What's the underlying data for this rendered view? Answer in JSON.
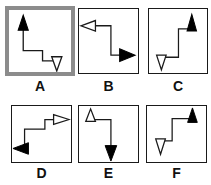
{
  "figure": {
    "background_color": "#ffffff",
    "stroke_color": "#1a1a1a",
    "fill_color": "#000000",
    "open_fill_color": "#ffffff",
    "selection_color": "#8c8c8c",
    "panel_count": 6,
    "rows": 2,
    "columns": 3
  },
  "panels": [
    {
      "id": "A",
      "label": "A",
      "selected": true,
      "start_arrow": {
        "name": "filled-up-arrow",
        "direction": "up",
        "style": "filled",
        "position": "top-left"
      },
      "end_arrow": {
        "name": "open-down-arrow",
        "direction": "down",
        "style": "open",
        "position": "bottom-right"
      },
      "path": "descending-staircase"
    },
    {
      "id": "B",
      "label": "B",
      "selected": false,
      "start_arrow": {
        "name": "open-left-arrow",
        "direction": "left",
        "style": "open",
        "position": "top-left"
      },
      "end_arrow": {
        "name": "filled-right-arrow",
        "direction": "right",
        "style": "filled",
        "position": "bottom-right"
      },
      "path": "descending-staircase"
    },
    {
      "id": "C",
      "label": "C",
      "selected": false,
      "start_arrow": {
        "name": "open-down-arrow",
        "direction": "down",
        "style": "open",
        "position": "bottom-left"
      },
      "end_arrow": {
        "name": "filled-up-arrow",
        "direction": "up",
        "style": "filled",
        "position": "top-right"
      },
      "path": "ascending-staircase"
    },
    {
      "id": "D",
      "label": "D",
      "selected": false,
      "start_arrow": {
        "name": "filled-left-arrow",
        "direction": "left",
        "style": "filled",
        "position": "bottom-left"
      },
      "end_arrow": {
        "name": "open-right-arrow",
        "direction": "right",
        "style": "open",
        "position": "top-right"
      },
      "path": "ascending-staircase"
    },
    {
      "id": "E",
      "label": "E",
      "selected": false,
      "start_arrow": {
        "name": "open-up-arrow",
        "direction": "up",
        "style": "open",
        "position": "top-left"
      },
      "end_arrow": {
        "name": "filled-down-arrow",
        "direction": "down",
        "style": "filled",
        "position": "bottom-right"
      },
      "path": "descending-staircase"
    },
    {
      "id": "F",
      "label": "F",
      "selected": false,
      "start_arrow": {
        "name": "open-down-arrow",
        "direction": "down",
        "style": "open",
        "position": "bottom-left"
      },
      "end_arrow": {
        "name": "filled-up-arrow",
        "direction": "up",
        "style": "filled",
        "position": "top-right"
      },
      "path": "ascending-staircase"
    }
  ]
}
